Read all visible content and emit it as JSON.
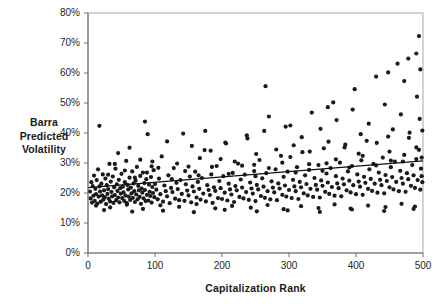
{
  "chart_data": {
    "type": "scatter",
    "title": "",
    "xlabel": "Capitalization Rank",
    "ylabel": "Barra Predicted Volatility",
    "ylabel_lines": [
      "Barra",
      "Predicted",
      "Volatility"
    ],
    "xlim": [
      0,
      500
    ],
    "ylim": [
      0,
      0.8
    ],
    "grid": false,
    "legend": null,
    "xticks": [
      0,
      100,
      200,
      300,
      400,
      500
    ],
    "xtick_labels": [
      "0",
      "100",
      "200",
      "300",
      "400",
      "500"
    ],
    "yticks": [
      0,
      0.1,
      0.2,
      0.3,
      0.4,
      0.5,
      0.6,
      0.7,
      0.8
    ],
    "ytick_labels": [
      "0%",
      "10%",
      "20%",
      "30%",
      "40%",
      "50%",
      "60%",
      "70%",
      "80%"
    ],
    "marker": {
      "shape": "dot",
      "size": 2.1,
      "color": "#1a1a1a"
    },
    "trendline": {
      "type": "linear",
      "x": [
        0,
        500
      ],
      "y": [
        0.218,
        0.307
      ],
      "color": "#111111",
      "width": 1.3
    },
    "points": [
      [
        3,
        0.205
      ],
      [
        4,
        0.182
      ],
      [
        5,
        0.236
      ],
      [
        6,
        0.168
      ],
      [
        7,
        0.223
      ],
      [
        8,
        0.191
      ],
      [
        9,
        0.258
      ],
      [
        10,
        0.174
      ],
      [
        11,
        0.214
      ],
      [
        12,
        0.196
      ],
      [
        13,
        0.243
      ],
      [
        14,
        0.165
      ],
      [
        15,
        0.279
      ],
      [
        16,
        0.188
      ],
      [
        17,
        0.222
      ],
      [
        18,
        0.205
      ],
      [
        19,
        0.171
      ],
      [
        20,
        0.231
      ],
      [
        21,
        0.192
      ],
      [
        22,
        0.262
      ],
      [
        23,
        0.178
      ],
      [
        24,
        0.209
      ],
      [
        25,
        0.186
      ],
      [
        26,
        0.248
      ],
      [
        27,
        0.163
      ],
      [
        28,
        0.226
      ],
      [
        29,
        0.197
      ],
      [
        30,
        0.213
      ],
      [
        31,
        0.181
      ],
      [
        32,
        0.297
      ],
      [
        33,
        0.172
      ],
      [
        34,
        0.238
      ],
      [
        35,
        0.204
      ],
      [
        36,
        0.189
      ],
      [
        37,
        0.255
      ],
      [
        38,
        0.167
      ],
      [
        39,
        0.219
      ],
      [
        40,
        0.193
      ],
      [
        41,
        0.281
      ],
      [
        42,
        0.176
      ],
      [
        43,
        0.229
      ],
      [
        44,
        0.207
      ],
      [
        45,
        0.185
      ],
      [
        46,
        0.244
      ],
      [
        47,
        0.169
      ],
      [
        48,
        0.216
      ],
      [
        49,
        0.198
      ],
      [
        50,
        0.264
      ],
      [
        51,
        0.183
      ],
      [
        52,
        0.221
      ],
      [
        53,
        0.202
      ],
      [
        54,
        0.174
      ],
      [
        55,
        0.236
      ],
      [
        56,
        0.191
      ],
      [
        57,
        0.307
      ],
      [
        58,
        0.166
      ],
      [
        59,
        0.227
      ],
      [
        60,
        0.212
      ],
      [
        61,
        0.188
      ],
      [
        62,
        0.251
      ],
      [
        63,
        0.177
      ],
      [
        64,
        0.218
      ],
      [
        65,
        0.199
      ],
      [
        66,
        0.272
      ],
      [
        67,
        0.184
      ],
      [
        68,
        0.232
      ],
      [
        69,
        0.206
      ],
      [
        70,
        0.17
      ],
      [
        71,
        0.241
      ],
      [
        72,
        0.195
      ],
      [
        73,
        0.287
      ],
      [
        74,
        0.179
      ],
      [
        75,
        0.224
      ],
      [
        76,
        0.209
      ],
      [
        77,
        0.187
      ],
      [
        78,
        0.257
      ],
      [
        79,
        0.164
      ],
      [
        80,
        0.215
      ],
      [
        81,
        0.201
      ],
      [
        82,
        0.268
      ],
      [
        83,
        0.182
      ],
      [
        84,
        0.233
      ],
      [
        85,
        0.21
      ],
      [
        86,
        0.173
      ],
      [
        87,
        0.246
      ],
      [
        88,
        0.194
      ],
      [
        89,
        0.396
      ],
      [
        90,
        0.175
      ],
      [
        91,
        0.228
      ],
      [
        92,
        0.204
      ],
      [
        93,
        0.19
      ],
      [
        94,
        0.253
      ],
      [
        95,
        0.168
      ],
      [
        96,
        0.22
      ],
      [
        97,
        0.2
      ],
      [
        98,
        0.276
      ],
      [
        99,
        0.186
      ],
      [
        100,
        0.23
      ],
      [
        102,
        0.211
      ],
      [
        104,
        0.179
      ],
      [
        106,
        0.248
      ],
      [
        108,
        0.196
      ],
      [
        110,
        0.322
      ],
      [
        112,
        0.171
      ],
      [
        114,
        0.225
      ],
      [
        116,
        0.206
      ],
      [
        118,
        0.189
      ],
      [
        120,
        0.259
      ],
      [
        122,
        0.166
      ],
      [
        124,
        0.217
      ],
      [
        126,
        0.203
      ],
      [
        128,
        0.283
      ],
      [
        130,
        0.181
      ],
      [
        132,
        0.234
      ],
      [
        134,
        0.213
      ],
      [
        136,
        0.176
      ],
      [
        138,
        0.243
      ],
      [
        140,
        0.197
      ],
      [
        142,
        0.398
      ],
      [
        144,
        0.174
      ],
      [
        146,
        0.229
      ],
      [
        148,
        0.208
      ],
      [
        150,
        0.192
      ],
      [
        152,
        0.255
      ],
      [
        154,
        0.169
      ],
      [
        156,
        0.222
      ],
      [
        158,
        0.205
      ],
      [
        160,
        0.271
      ],
      [
        162,
        0.185
      ],
      [
        164,
        0.237
      ],
      [
        166,
        0.214
      ],
      [
        168,
        0.178
      ],
      [
        170,
        0.25
      ],
      [
        172,
        0.198
      ],
      [
        174,
        0.343
      ],
      [
        176,
        0.172
      ],
      [
        178,
        0.226
      ],
      [
        180,
        0.21
      ],
      [
        182,
        0.193
      ],
      [
        184,
        0.262
      ],
      [
        186,
        0.167
      ],
      [
        188,
        0.219
      ],
      [
        190,
        0.207
      ],
      [
        192,
        0.29
      ],
      [
        194,
        0.183
      ],
      [
        196,
        0.24
      ],
      [
        198,
        0.216
      ],
      [
        200,
        0.18
      ],
      [
        202,
        0.256
      ],
      [
        204,
        0.201
      ],
      [
        206,
        0.365
      ],
      [
        208,
        0.175
      ],
      [
        210,
        0.231
      ],
      [
        212,
        0.212
      ],
      [
        214,
        0.195
      ],
      [
        216,
        0.267
      ],
      [
        218,
        0.17
      ],
      [
        220,
        0.223
      ],
      [
        222,
        0.209
      ],
      [
        224,
        0.298
      ],
      [
        226,
        0.187
      ],
      [
        228,
        0.245
      ],
      [
        230,
        0.218
      ],
      [
        232,
        0.182
      ],
      [
        234,
        0.261
      ],
      [
        236,
        0.203
      ],
      [
        238,
        0.382
      ],
      [
        240,
        0.177
      ],
      [
        242,
        0.235
      ],
      [
        244,
        0.215
      ],
      [
        246,
        0.198
      ],
      [
        248,
        0.273
      ],
      [
        250,
        0.173
      ],
      [
        252,
        0.227
      ],
      [
        254,
        0.212
      ],
      [
        256,
        0.31
      ],
      [
        258,
        0.19
      ],
      [
        260,
        0.249
      ],
      [
        262,
        0.221
      ],
      [
        264,
        0.184
      ],
      [
        266,
        0.266
      ],
      [
        268,
        0.206
      ],
      [
        270,
        0.455
      ],
      [
        272,
        0.179
      ],
      [
        274,
        0.239
      ],
      [
        276,
        0.218
      ],
      [
        278,
        0.202
      ],
      [
        280,
        0.279
      ],
      [
        282,
        0.176
      ],
      [
        284,
        0.232
      ],
      [
        286,
        0.215
      ],
      [
        288,
        0.324
      ],
      [
        290,
        0.194
      ],
      [
        292,
        0.254
      ],
      [
        294,
        0.225
      ],
      [
        296,
        0.188
      ],
      [
        298,
        0.271
      ],
      [
        300,
        0.21
      ],
      [
        302,
        0.425
      ],
      [
        304,
        0.183
      ],
      [
        306,
        0.244
      ],
      [
        308,
        0.222
      ],
      [
        310,
        0.206
      ],
      [
        312,
        0.286
      ],
      [
        314,
        0.18
      ],
      [
        316,
        0.237
      ],
      [
        318,
        0.219
      ],
      [
        320,
        0.336
      ],
      [
        322,
        0.199
      ],
      [
        324,
        0.259
      ],
      [
        326,
        0.23
      ],
      [
        328,
        0.192
      ],
      [
        330,
        0.277
      ],
      [
        332,
        0.214
      ],
      [
        334,
        0.468
      ],
      [
        336,
        0.187
      ],
      [
        338,
        0.25
      ],
      [
        340,
        0.227
      ],
      [
        342,
        0.211
      ],
      [
        344,
        0.293
      ],
      [
        346,
        0.185
      ],
      [
        348,
        0.242
      ],
      [
        350,
        0.224
      ],
      [
        352,
        0.349
      ],
      [
        354,
        0.204
      ],
      [
        356,
        0.265
      ],
      [
        358,
        0.235
      ],
      [
        360,
        0.197
      ],
      [
        362,
        0.283
      ],
      [
        364,
        0.22
      ],
      [
        366,
        0.502
      ],
      [
        368,
        0.191
      ],
      [
        370,
        0.256
      ],
      [
        372,
        0.232
      ],
      [
        374,
        0.216
      ],
      [
        376,
        0.301
      ],
      [
        378,
        0.189
      ],
      [
        380,
        0.248
      ],
      [
        382,
        0.229
      ],
      [
        384,
        0.361
      ],
      [
        386,
        0.209
      ],
      [
        388,
        0.272
      ],
      [
        390,
        0.241
      ],
      [
        392,
        0.202
      ],
      [
        394,
        0.29
      ],
      [
        396,
        0.226
      ],
      [
        398,
        0.546
      ],
      [
        400,
        0.196
      ],
      [
        402,
        0.262
      ],
      [
        404,
        0.238
      ],
      [
        406,
        0.221
      ],
      [
        408,
        0.309
      ],
      [
        410,
        0.194
      ],
      [
        412,
        0.254
      ],
      [
        414,
        0.234
      ],
      [
        416,
        0.374
      ],
      [
        418,
        0.214
      ],
      [
        420,
        0.279
      ],
      [
        422,
        0.247
      ],
      [
        424,
        0.207
      ],
      [
        426,
        0.297
      ],
      [
        428,
        0.231
      ],
      [
        430,
        0.588
      ],
      [
        432,
        0.201
      ],
      [
        434,
        0.268
      ],
      [
        436,
        0.244
      ],
      [
        438,
        0.226
      ],
      [
        440,
        0.318
      ],
      [
        442,
        0.199
      ],
      [
        444,
        0.26
      ],
      [
        446,
        0.24
      ],
      [
        448,
        0.388
      ],
      [
        450,
        0.219
      ],
      [
        452,
        0.286
      ],
      [
        454,
        0.253
      ],
      [
        456,
        0.212
      ],
      [
        458,
        0.305
      ],
      [
        460,
        0.237
      ],
      [
        462,
        0.631
      ],
      [
        464,
        0.206
      ],
      [
        466,
        0.274
      ],
      [
        468,
        0.25
      ],
      [
        470,
        0.231
      ],
      [
        472,
        0.327
      ],
      [
        474,
        0.204
      ],
      [
        476,
        0.266
      ],
      [
        478,
        0.246
      ],
      [
        480,
        0.401
      ],
      [
        482,
        0.224
      ],
      [
        484,
        0.293
      ],
      [
        486,
        0.259
      ],
      [
        488,
        0.217
      ],
      [
        490,
        0.313
      ],
      [
        492,
        0.243
      ],
      [
        494,
        0.723
      ],
      [
        496,
        0.211
      ],
      [
        497,
        0.281
      ],
      [
        498,
        0.256
      ],
      [
        499,
        0.236
      ],
      [
        45,
        0.333
      ],
      [
        62,
        0.351
      ],
      [
        78,
        0.311
      ],
      [
        95,
        0.289
      ],
      [
        118,
        0.372
      ],
      [
        133,
        0.298
      ],
      [
        155,
        0.357
      ],
      [
        167,
        0.316
      ],
      [
        183,
        0.341
      ],
      [
        205,
        0.368
      ],
      [
        219,
        0.305
      ],
      [
        237,
        0.392
      ],
      [
        251,
        0.33
      ],
      [
        263,
        0.407
      ],
      [
        281,
        0.345
      ],
      [
        295,
        0.421
      ],
      [
        307,
        0.359
      ],
      [
        319,
        0.386
      ],
      [
        331,
        0.338
      ],
      [
        347,
        0.414
      ],
      [
        359,
        0.371
      ],
      [
        371,
        0.443
      ],
      [
        383,
        0.352
      ],
      [
        395,
        0.478
      ],
      [
        407,
        0.396
      ],
      [
        419,
        0.431
      ],
      [
        431,
        0.367
      ],
      [
        443,
        0.495
      ],
      [
        455,
        0.412
      ],
      [
        467,
        0.462
      ],
      [
        479,
        0.384
      ],
      [
        491,
        0.521
      ],
      [
        495,
        0.447
      ],
      [
        499,
        0.408
      ],
      [
        30,
        0.261
      ],
      [
        55,
        0.275
      ],
      [
        70,
        0.251
      ],
      [
        88,
        0.268
      ],
      [
        105,
        0.284
      ],
      [
        125,
        0.246
      ],
      [
        145,
        0.273
      ],
      [
        165,
        0.259
      ],
      [
        185,
        0.287
      ],
      [
        210,
        0.264
      ],
      [
        230,
        0.291
      ],
      [
        250,
        0.256
      ],
      [
        270,
        0.283
      ],
      [
        290,
        0.301
      ],
      [
        310,
        0.268
      ],
      [
        330,
        0.296
      ],
      [
        350,
        0.274
      ],
      [
        370,
        0.312
      ],
      [
        390,
        0.285
      ],
      [
        410,
        0.324
      ],
      [
        430,
        0.292
      ],
      [
        450,
        0.338
      ],
      [
        470,
        0.305
      ],
      [
        490,
        0.352
      ],
      [
        498,
        0.318
      ],
      [
        12,
        0.158
      ],
      [
        33,
        0.152
      ],
      [
        58,
        0.161
      ],
      [
        82,
        0.147
      ],
      [
        108,
        0.159
      ],
      [
        136,
        0.154
      ],
      [
        162,
        0.163
      ],
      [
        190,
        0.149
      ],
      [
        215,
        0.157
      ],
      [
        243,
        0.151
      ],
      [
        268,
        0.16
      ],
      [
        292,
        0.146
      ],
      [
        318,
        0.156
      ],
      [
        344,
        0.15
      ],
      [
        368,
        0.162
      ],
      [
        392,
        0.148
      ],
      [
        418,
        0.158
      ],
      [
        444,
        0.153
      ],
      [
        468,
        0.164
      ],
      [
        488,
        0.155
      ],
      [
        24,
        0.143
      ],
      [
        66,
        0.138
      ],
      [
        112,
        0.141
      ],
      [
        158,
        0.136
      ],
      [
        204,
        0.144
      ],
      [
        252,
        0.139
      ],
      [
        298,
        0.142
      ],
      [
        346,
        0.137
      ],
      [
        394,
        0.145
      ],
      [
        442,
        0.14
      ],
      [
        486,
        0.147
      ],
      [
        40,
        0.297
      ],
      [
        96,
        0.305
      ],
      [
        150,
        0.288
      ],
      [
        198,
        0.313
      ],
      [
        248,
        0.294
      ],
      [
        302,
        0.32
      ],
      [
        356,
        0.299
      ],
      [
        404,
        0.331
      ],
      [
        452,
        0.308
      ],
      [
        494,
        0.344
      ],
      [
        17,
        0.424
      ],
      [
        85,
        0.438
      ],
      [
        175,
        0.407
      ],
      [
        265,
        0.556
      ],
      [
        358,
        0.486
      ],
      [
        448,
        0.602
      ],
      [
        478,
        0.648
      ],
      [
        490,
        0.665
      ],
      [
        472,
        0.573
      ],
      [
        496,
        0.612
      ]
    ]
  }
}
